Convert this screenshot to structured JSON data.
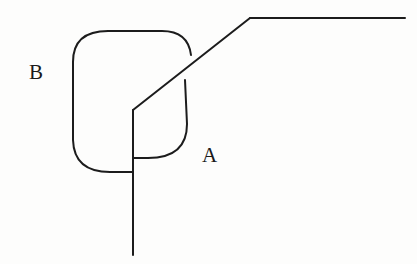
{
  "figure": {
    "type": "line-diagram",
    "background_color": "#fdfdfc",
    "stroke_color": "#1c1c1c",
    "width": 417,
    "height": 264,
    "labels": [
      {
        "id": "B",
        "text": "B",
        "x": 29,
        "y": 62
      },
      {
        "id": "A",
        "text": "A",
        "x": 202,
        "y": 145
      }
    ],
    "strokes": {
      "blob_top_left_arc": "M 73 118 L 73 62 Q 73 31 108 31 L 162 31 Q 188 31 191 55",
      "blob_right_arc": "M 185 80 L 187 124 Q 187 158 148 158 L 133 158",
      "blob_bottom_left_arc": "M 73 118 L 73 140 Q 74 172 110 172 L 133 172",
      "diagonal_line": "M 133 110 L 250 18",
      "top_horizontal_line": "M 250 18 L 405 18",
      "vertical_stem": "M 133 110 L 133 255"
    },
    "stroke_width": 2.0
  },
  "chart_data": {
    "type": "line",
    "title": "",
    "xlabel": "",
    "ylabel": "",
    "annotations": [
      "B",
      "A"
    ],
    "series": [
      {
        "name": "blob-outline-upper-left",
        "points": [
          [
            73,
            118
          ],
          [
            73,
            62
          ],
          [
            80,
            42
          ],
          [
            108,
            31
          ],
          [
            162,
            31
          ],
          [
            183,
            38
          ],
          [
            191,
            55
          ]
        ]
      },
      {
        "name": "blob-outline-right",
        "points": [
          [
            185,
            80
          ],
          [
            187,
            124
          ],
          [
            183,
            146
          ],
          [
            163,
            157
          ],
          [
            148,
            158
          ],
          [
            133,
            158
          ]
        ]
      },
      {
        "name": "blob-outline-lower-left",
        "points": [
          [
            73,
            118
          ],
          [
            73,
            140
          ],
          [
            79,
            162
          ],
          [
            98,
            171
          ],
          [
            110,
            172
          ],
          [
            133,
            172
          ]
        ]
      },
      {
        "name": "diagonal",
        "points": [
          [
            133,
            110
          ],
          [
            250,
            18
          ]
        ]
      },
      {
        "name": "top-horizontal",
        "points": [
          [
            250,
            18
          ],
          [
            405,
            18
          ]
        ]
      },
      {
        "name": "vertical-stem",
        "points": [
          [
            133,
            110
          ],
          [
            133,
            255
          ]
        ]
      }
    ]
  }
}
